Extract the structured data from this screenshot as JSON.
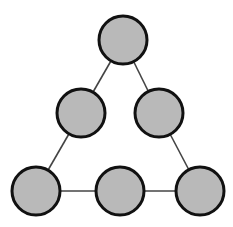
{
  "diagram": {
    "type": "graph",
    "colors": {
      "node_fill": "#b9b9b9",
      "node_stroke": "#111111",
      "edge": "#444444",
      "background": "#ffffff"
    },
    "node_radius": 24,
    "nodes": [
      {
        "id": "n1",
        "position": "top",
        "cx": 123,
        "cy": 40
      },
      {
        "id": "n2",
        "position": "middle-left",
        "cx": 81,
        "cy": 113
      },
      {
        "id": "n3",
        "position": "middle-right",
        "cx": 159,
        "cy": 113
      },
      {
        "id": "n4",
        "position": "bottom-left",
        "cx": 36,
        "cy": 191
      },
      {
        "id": "n5",
        "position": "bottom-middle",
        "cx": 120,
        "cy": 191
      },
      {
        "id": "n6",
        "position": "bottom-right",
        "cx": 200,
        "cy": 191
      }
    ],
    "edges": [
      {
        "from": "n1",
        "to": "n2"
      },
      {
        "from": "n1",
        "to": "n3"
      },
      {
        "from": "n2",
        "to": "n4"
      },
      {
        "from": "n3",
        "to": "n6"
      },
      {
        "from": "n4",
        "to": "n5"
      },
      {
        "from": "n5",
        "to": "n6"
      }
    ]
  }
}
